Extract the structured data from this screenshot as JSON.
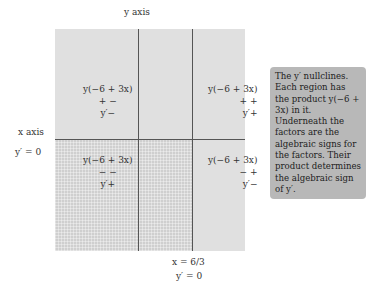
{
  "diagram": {
    "y_axis_label": "y axis",
    "x_axis_label": "x axis",
    "x_axis_nullcline": "y′ = 0",
    "vertical_nullcline_eq": "x = 6/3",
    "vertical_nullcline_sub": "y′ = 0",
    "regions": [
      {
        "position": "upper-left",
        "product": "y(−6 + 3x)",
        "signs": "+  −",
        "result": "y′−"
      },
      {
        "position": "upper-right",
        "product": "y(−6 + 3x)",
        "signs": "+  +",
        "result": "y′+"
      },
      {
        "position": "lower-left",
        "product": "y(−6 + 3x)",
        "signs": "−  −",
        "result": "y′+"
      },
      {
        "position": "lower-right",
        "product": "y(−6 + 3x)",
        "signs": "−  +",
        "result": "y′−"
      }
    ],
    "note": "The y′ nullclines. Each region has the product y(−6 + 3x) in it. Underneath the factors are the algebraic signs for the factors. Their product determines the algebraic sign of y′."
  },
  "colors": {
    "light_region": "#e0e0e0",
    "dark_region": "#cfcfcf",
    "lines": "#555555",
    "note_bg": "#b8b8b8"
  }
}
